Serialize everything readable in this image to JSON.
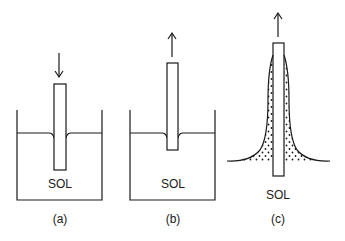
{
  "figure": {
    "panels": [
      {
        "id": "a",
        "caption": "(a)",
        "solution_label": "SOL",
        "motion": "down",
        "description": "substrate dipping into sol"
      },
      {
        "id": "b",
        "caption": "(b)",
        "solution_label": "SOL",
        "motion": "up",
        "description": "substrate being withdrawn from sol"
      },
      {
        "id": "c",
        "caption": "(c)",
        "solution_label": "SOL",
        "motion": "up",
        "description": "withdrawn substrate with entrained sol film"
      }
    ],
    "colors": {
      "stroke": "#1a1a1a",
      "background": "#ffffff"
    }
  }
}
